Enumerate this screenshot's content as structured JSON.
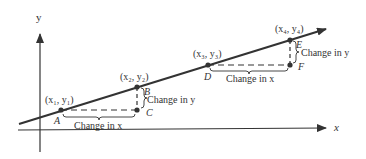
{
  "diagram": {
    "type": "slope-of-line-illustration",
    "axes": {
      "x_label": "x",
      "y_label": "y"
    },
    "colors": {
      "ink": "#333333",
      "background": "#ffffff"
    },
    "triangles": [
      {
        "point1": {
          "letter": "A",
          "coord_label": "(x₁, y₁)"
        },
        "point2": {
          "letter": "B",
          "coord_label": "(x₂, y₂)"
        },
        "corner": {
          "letter": "C"
        },
        "run_label": "Change in x",
        "rise_label": "Change in y"
      },
      {
        "point1": {
          "letter": "D",
          "coord_label": "(x₃, y₃)"
        },
        "point2": {
          "letter": "E",
          "coord_label": "(x₄, y₄)"
        },
        "corner": {
          "letter": "F"
        },
        "run_label": "Change in x",
        "rise_label": "Change in y"
      }
    ]
  }
}
